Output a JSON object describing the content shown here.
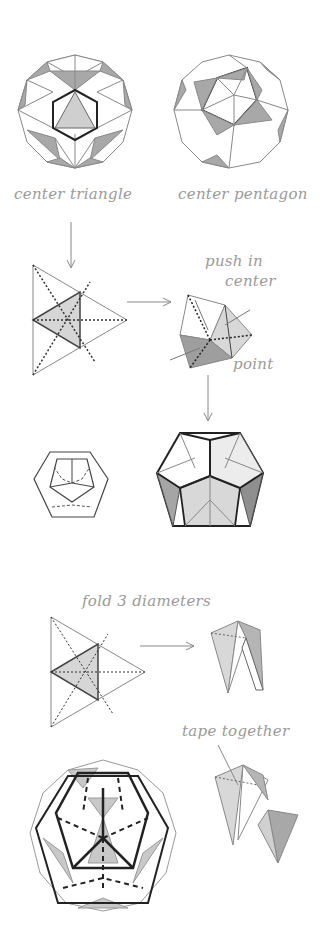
{
  "labels": {
    "center_triangle": "center triangle",
    "center_pentagon": "center pentagon",
    "push_in_center_line1": "push in",
    "push_in_center_line2": "center",
    "point": "point",
    "fold_3_diameters": "fold 3 diameters",
    "tape_together": "tape together"
  },
  "colors": {
    "shade_light": "#d8d8d8",
    "shade_mid": "#b5b5b5",
    "shade_dark": "#9a9a9a",
    "line": "#777777",
    "bold": "#222222",
    "text": "#9a9a9a"
  }
}
